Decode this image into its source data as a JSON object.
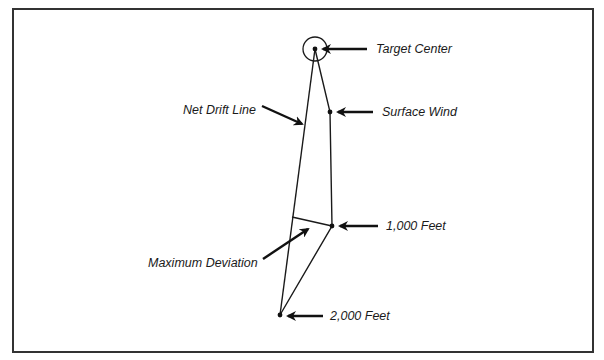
{
  "diagram": {
    "colors": {
      "line": "#1a1a1a",
      "frame": "#333333",
      "background": "#ffffff"
    },
    "labels": {
      "target_center": "Target Center",
      "surface_wind": "Surface Wind",
      "net_drift_line": "Net Drift Line",
      "one_thousand_feet": "1,000 Feet",
      "maximum_deviation": "Maximum Deviation",
      "two_thousand_feet": "2,000 Feet"
    },
    "points": [
      {
        "name": "Target Center",
        "x": 315,
        "y": 49
      },
      {
        "name": "Surface Wind",
        "x": 330,
        "y": 112
      },
      {
        "name": "1,000 Feet",
        "x": 332,
        "y": 226
      },
      {
        "name": "2,000 Feet",
        "x": 280,
        "y": 315
      }
    ]
  }
}
